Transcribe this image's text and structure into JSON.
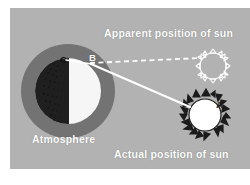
{
  "figure": {
    "background_color": "#ffffff",
    "panel_color": "#b2b2b2"
  },
  "labels": {
    "apparent_position": "Apparent position of sun",
    "actual_position": "Actual position of sun",
    "atmosphere": "Atmosphere",
    "point_a": "A",
    "point_b": "B",
    "point_c": "C"
  },
  "elements": {
    "earth": {
      "name": "earth-globe",
      "lit_side_color": "#f7f7f7",
      "dark_side_color": "#232323",
      "atmosphere_ring_color": "#737373"
    },
    "apparent_sun": {
      "name": "apparent-sun",
      "style": "outline",
      "color": "#ffffff",
      "ray_count": 16
    },
    "actual_sun": {
      "name": "actual-sun",
      "style": "filled-outline",
      "disc_color": "#ffffff",
      "ray_color": "#1a1a1a",
      "ray_count": 16
    },
    "apparent_ray": {
      "name": "apparent-light-ray",
      "line_style": "dashed",
      "color": "#ffffff"
    },
    "actual_ray": {
      "name": "actual-light-ray",
      "line_style": "solid",
      "color": "#ffffff"
    }
  }
}
